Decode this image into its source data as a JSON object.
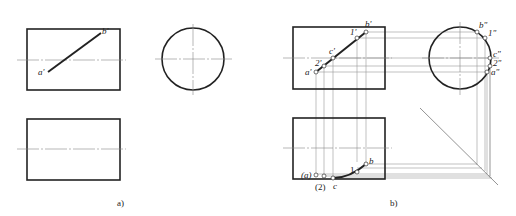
{
  "figure": {
    "panel_a": {
      "caption": "a)",
      "front_view_labels": {
        "a": "a'",
        "b": "b'"
      }
    },
    "panel_b": {
      "caption": "b)",
      "front_view_labels": {
        "a": "a'",
        "two": "2'",
        "c": "c'",
        "one": "1'",
        "b": "b'"
      },
      "side_view_labels": {
        "b": "b\"",
        "one": "1\"",
        "c": "c\"",
        "two": "2\"",
        "a": "a\""
      },
      "top_view_labels": {
        "a": "(a)",
        "two": "(2)",
        "c": "c",
        "one": "1",
        "b": "b"
      }
    }
  }
}
